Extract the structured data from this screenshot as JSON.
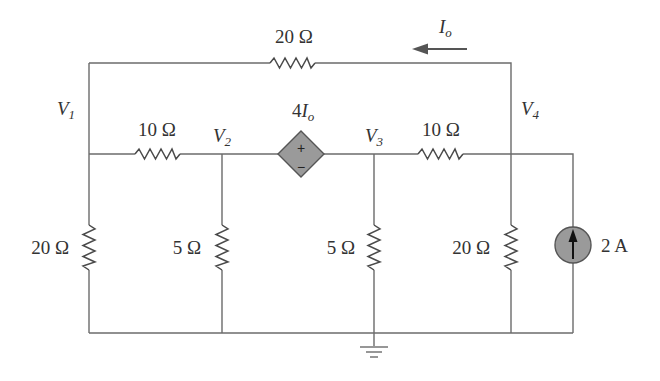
{
  "diagram": {
    "type": "circuit-schematic",
    "colors": {
      "wire": "#6b6b6b",
      "source_fill": "#9a9a9a",
      "arrow": "#555555",
      "text": "#333333"
    },
    "nodes": {
      "v1": {
        "main": "V",
        "sub": "1"
      },
      "v2": {
        "main": "V",
        "sub": "2"
      },
      "v3": {
        "main": "V",
        "sub": "3"
      },
      "v4": {
        "main": "V",
        "sub": "4"
      }
    },
    "current_label": {
      "main": "I",
      "sub": "o"
    },
    "resistors": {
      "top": "20 Ω",
      "left_series": "10 Ω",
      "right_series": "10 Ω",
      "shunt_v1": "20 Ω",
      "shunt_v2": "5 Ω",
      "shunt_v3": "5 Ω",
      "shunt_v4": "20 Ω"
    },
    "dependent_source": {
      "gain": "4",
      "control": {
        "main": "I",
        "sub": "o"
      },
      "plus": "+",
      "minus": "−"
    },
    "current_source": {
      "value": "2 A"
    }
  }
}
